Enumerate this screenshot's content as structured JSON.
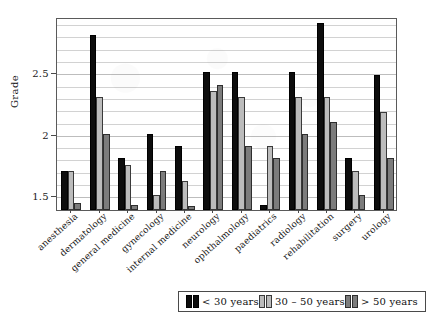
{
  "chart_data": {
    "type": "bar",
    "title": "",
    "xlabel": "",
    "ylabel": "Grade",
    "ylim": [
      1.38,
      2.95
    ],
    "yticks": [
      1.5,
      2,
      2.5
    ],
    "ytick_labels": [
      "1.5",
      "2",
      "2.5"
    ],
    "grid": true,
    "minor_grid_step": 0.1,
    "legend_position": "bottom-right",
    "categories": [
      "anesthesia",
      "dermatology",
      "general medicine",
      "gynecology",
      "internal medicine",
      "neurology",
      "ophthalmology",
      "paediatrics",
      "radiology",
      "rehabilitation",
      "surgery",
      "urology"
    ],
    "series": [
      {
        "name": "< 30 years",
        "color": "#0d0d0d",
        "values": [
          1.7,
          2.8,
          1.8,
          2.0,
          1.9,
          2.5,
          2.5,
          1.42,
          2.5,
          2.9,
          1.8,
          2.48
        ]
      },
      {
        "name": "30 – 50 years",
        "color": "#bcbcbc",
        "values": [
          1.7,
          2.3,
          1.75,
          1.5,
          1.62,
          2.35,
          2.3,
          1.9,
          2.3,
          2.3,
          1.7,
          2.18
        ]
      },
      {
        "name": "> 50 years",
        "color": "#7c7c7c",
        "values": [
          1.44,
          2.0,
          1.42,
          1.7,
          1.41,
          2.4,
          1.9,
          1.8,
          2.0,
          2.1,
          1.5,
          1.8
        ]
      }
    ]
  },
  "legend": {
    "entries": [
      {
        "label": "< 30 years"
      },
      {
        "label": "30 – 50 years"
      },
      {
        "label": "> 50 years"
      }
    ]
  }
}
